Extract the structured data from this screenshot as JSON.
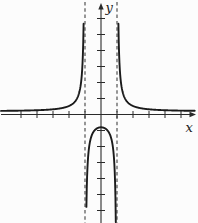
{
  "chart_data": {
    "type": "line",
    "title": "",
    "xlabel": "x",
    "ylabel": "y",
    "function": "y = a / (x^2 - b)",
    "coefficients": {
      "a": 1,
      "b": 1
    },
    "asymptotes_x": [
      -1,
      1
    ],
    "x_ticks": [
      -5,
      -4,
      -3,
      -2,
      -1,
      1,
      2,
      3,
      4,
      5
    ],
    "y_ticks": [
      -6,
      -5,
      -4,
      -3,
      -2,
      -1,
      1,
      2,
      3,
      4,
      5,
      6
    ],
    "xlim": [
      -6.25,
      5.9
    ],
    "ylim": [
      -6.8,
      7.0
    ],
    "grid": false,
    "legend_position": "none",
    "branches": [
      {
        "name": "left",
        "px_from": 1,
        "px_to": 85
      },
      {
        "name": "middle",
        "px_from": 85,
        "px_to": 117
      },
      {
        "name": "right",
        "px_from": 117,
        "px_to": 195
      }
    ],
    "style": {
      "curve_color": "#1b1b1b",
      "axis_color": "#2a2a2a",
      "asymptote_color": "#3a3a3a",
      "background": "#fcfcfc",
      "curve_width": 1.9,
      "axis_width": 1.1,
      "tick_half_length": 3.5,
      "asymptote_dash": "3.5 2.8",
      "vertical_offset": 0.2
    },
    "layout": {
      "canvas": [
        198,
        223
      ],
      "origin_px": [
        101,
        114.5
      ],
      "unit_px": 16
    }
  }
}
